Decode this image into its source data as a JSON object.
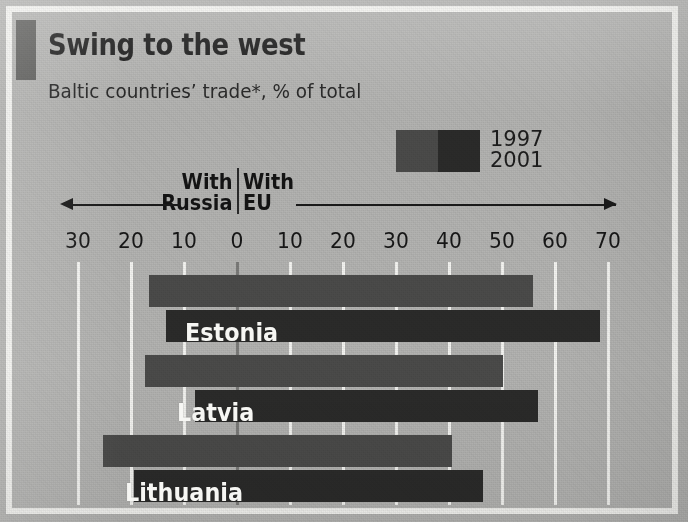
{
  "figure": {
    "title": "Swing to the west",
    "subtitle": "Baltic countries’ trade*, % of total"
  },
  "legend": {
    "entries": [
      {
        "label": "1997",
        "color": "#4b4b4a"
      },
      {
        "label": "2001",
        "color": "#2b2b2a"
      }
    ]
  },
  "axis": {
    "left_direction_label": "With\nRussia",
    "left_direction_line1": "With",
    "left_direction_line2": "Russia",
    "right_direction_line1": "With",
    "right_direction_line2": "EU",
    "tick_labels": [
      "30",
      "20",
      "10",
      "0",
      "10",
      "20",
      "30",
      "40",
      "50",
      "60",
      "70"
    ]
  },
  "colors": {
    "background": "#b3b3b1",
    "frame": "#f2f2ef",
    "gridline": "#f4f4f1",
    "zeroline": "#7b7b79",
    "title_marker": "#5d5d5b",
    "bar_1997": "#4b4b4a",
    "bar_2001": "#2b2b2a",
    "text": "#1b1b1b",
    "bar_label_text": "#f6f6f3"
  },
  "chart_data": {
    "type": "bar",
    "orientation": "horizontal-diverging",
    "title": "Swing to the west",
    "subtitle": "Baltic countries’ trade*, % of total",
    "xlabel": "% of total",
    "ylabel": "",
    "left_axis_label": "With Russia",
    "right_axis_label": "With EU",
    "xlim": [
      -30,
      70
    ],
    "xticks": [
      -30,
      -20,
      -10,
      0,
      10,
      20,
      30,
      40,
      50,
      60,
      70
    ],
    "xticklabels": [
      "30",
      "20",
      "10",
      "0",
      "10",
      "20",
      "30",
      "40",
      "50",
      "60",
      "70"
    ],
    "grid": true,
    "legend_position": "top-right",
    "categories": [
      "Estonia",
      "Latvia",
      "Lithuania"
    ],
    "series": [
      {
        "name": "1997",
        "color": "#4b4b4a",
        "with_russia": [
          16.6,
          17.4,
          25.3
        ],
        "with_eu": [
          55.8,
          50.2,
          40.6
        ]
      },
      {
        "name": "2001",
        "color": "#2b2b2a",
        "with_russia": [
          13.4,
          8.0,
          19.4
        ],
        "with_eu": [
          68.5,
          56.8,
          46.4
        ]
      }
    ]
  },
  "bars": [
    {
      "country": "Estonia",
      "year": "1997",
      "russia": 16.6,
      "eu": 55.8
    },
    {
      "country": "Estonia",
      "year": "2001",
      "russia": 13.4,
      "eu": 68.5
    },
    {
      "country": "Latvia",
      "year": "1997",
      "russia": 17.4,
      "eu": 50.2
    },
    {
      "country": "Latvia",
      "year": "2001",
      "russia": 8.0,
      "eu": 56.8
    },
    {
      "country": "Lithuania",
      "year": "1997",
      "russia": 25.3,
      "eu": 40.6
    },
    {
      "country": "Lithuania",
      "year": "2001",
      "russia": 19.4,
      "eu": 46.4
    }
  ]
}
